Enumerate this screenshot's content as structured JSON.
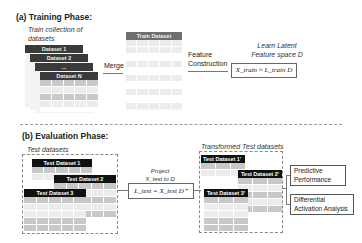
{
  "training": {
    "title": "(a) Training Phase:",
    "collection_label": "Train collection of datasets",
    "datasets": [
      "Dataset 1",
      "Dataset 2",
      "...",
      "Dataset N"
    ],
    "merge_label": "Merge",
    "train_dataset_label": "Train Dataset",
    "feature_construction_label": "Feature Construction",
    "latent_label_line1": "Learn Latent",
    "latent_label_line2": "Feature space D",
    "formula": "X_train ≈ L_train D"
  },
  "evaluation": {
    "title": "(b) Evaluation Phase:",
    "test_datasets_label": "Test datasets",
    "test_datasets": [
      "Test Dataset 1",
      "Test Dataset 2",
      "Test Dataset 3"
    ],
    "project_label_line1": "Project",
    "project_label_line2": "X_test to D",
    "formula": "L_test = X_test D⁺",
    "transformed_label": "Transformed Test datasets",
    "transformed_datasets": [
      "Test Dataset 1'",
      "Test Dataset 2'",
      "Test Dataset 3'"
    ],
    "outputs": [
      {
        "line1": "Predictive",
        "line2": "Performance"
      },
      {
        "line1": "Differential",
        "line2": "Activation Analysis"
      }
    ]
  }
}
